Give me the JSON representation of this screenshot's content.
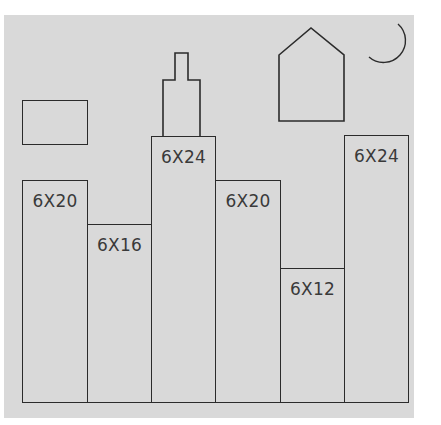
{
  "colors": {
    "background": "#d9d9d9",
    "stroke": "#2b2b2b",
    "text": "#3a3a3a"
  },
  "frames": [
    {
      "id": "frame-1",
      "label": "6X20",
      "x": 22,
      "y": 180,
      "w": 65,
      "h": 222
    },
    {
      "id": "frame-2",
      "label": "6X16",
      "x": 87,
      "y": 224,
      "w": 64,
      "h": 178
    },
    {
      "id": "frame-3",
      "label": "6X24",
      "x": 151,
      "y": 136,
      "w": 64,
      "h": 266
    },
    {
      "id": "frame-4",
      "label": "6X20",
      "x": 215,
      "y": 180,
      "w": 65,
      "h": 222
    },
    {
      "id": "frame-5",
      "label": "6X12",
      "x": 280,
      "y": 268,
      "w": 64,
      "h": 134
    },
    {
      "id": "frame-6",
      "label": "6X24",
      "x": 344,
      "y": 135,
      "w": 64,
      "h": 267
    }
  ],
  "decorations": {
    "rectangle": "unlabeled-rectangle",
    "tower": "tower-spire",
    "house": "house-outline",
    "moon": "crescent-moon"
  }
}
